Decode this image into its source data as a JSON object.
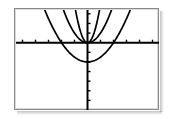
{
  "screen": {
    "width": 173,
    "height": 119,
    "background": "#ffffff",
    "device": "graphing-calculator-screen"
  },
  "frame": {
    "border_color": "#8a8a8a",
    "fill": "#ffffff",
    "x": 14,
    "y": 8,
    "width": 145,
    "height": 102
  },
  "chart_data": {
    "type": "line",
    "title": "",
    "subtitle": "",
    "xlabel": "",
    "ylabel": "",
    "grid": false,
    "legend": "none",
    "axis_color": "#000000",
    "curve_color": "#000000",
    "xlim": [
      -5.5,
      5.5
    ],
    "ylim": [
      -7.0,
      3.4
    ],
    "xticks": [
      -5,
      -4,
      -3,
      -2,
      -1,
      1,
      2,
      3,
      4,
      5
    ],
    "yticks": [
      -6,
      -5,
      -4,
      -3,
      -2,
      -1,
      1,
      2,
      3
    ],
    "tick_length_px": 3,
    "axes": {
      "x_axis_y_value": 0,
      "y_axis_x_value": 0,
      "x_axis_pixel_y": 49,
      "y_axis_pixel_x": 73
    },
    "series": [
      {
        "name": "y = 4x^2",
        "form": "parabola",
        "a": 4.0,
        "h": 0.0,
        "k": 0.0,
        "opens": "up",
        "width": "narrow",
        "vertex": [
          0,
          0
        ]
      },
      {
        "name": "y = x^2",
        "form": "parabola",
        "a": 1.0,
        "h": 0.0,
        "k": 0.0,
        "opens": "up",
        "width": "medium",
        "vertex": [
          0,
          0
        ]
      },
      {
        "name": "y = 0.5x^2 - 2",
        "form": "parabola",
        "a": 0.5,
        "h": 0.0,
        "k": -2.0,
        "opens": "up",
        "width": "wide",
        "vertex": [
          0,
          -2
        ]
      }
    ],
    "annotations": []
  }
}
